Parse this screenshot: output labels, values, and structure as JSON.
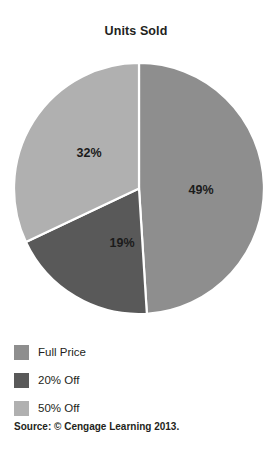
{
  "chart_data": {
    "type": "pie",
    "title": "Units Sold",
    "xlabel": "",
    "ylabel": "",
    "categories": [
      "Full Price",
      "20% Off",
      "50% Off"
    ],
    "values": [
      49,
      19,
      32
    ],
    "value_unit": "%",
    "data_labels": [
      "49%",
      "19%",
      "32%"
    ],
    "colors": [
      "#8e8e8e",
      "#595959",
      "#b0b0b0"
    ],
    "slice_border_color": "#ffffff",
    "start_angle_deg": 0,
    "direction": "clockwise",
    "legend_position": "bottom-left",
    "grid": false,
    "slices": [
      {
        "label": "Full Price",
        "value": 49,
        "data_label": "49%",
        "color": "#8e8e8e"
      },
      {
        "label": "20% Off",
        "value": 19,
        "data_label": "19%",
        "color": "#595959"
      },
      {
        "label": "50% Off",
        "value": 32,
        "data_label": "32%",
        "color": "#b0b0b0"
      }
    ],
    "source": "Source: © Cengage Learning 2013."
  },
  "legend": {
    "items": [
      {
        "label": "Full Price",
        "color": "#8e8e8e"
      },
      {
        "label": "20% Off",
        "color": "#595959"
      },
      {
        "label": "50% Off",
        "color": "#b0b0b0"
      }
    ]
  },
  "footer": {
    "source": "Source: © Cengage Learning 2013."
  },
  "colors": {
    "full_price": "#8e8e8e",
    "twenty_off": "#595959",
    "fifty_off": "#b0b0b0",
    "text": "#231f20",
    "background": "#ffffff"
  }
}
